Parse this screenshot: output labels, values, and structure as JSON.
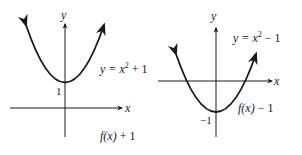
{
  "figure": {
    "panels": [
      {
        "id": "left",
        "equation": {
          "prefix": "y = x",
          "exp": "2",
          "suffix": " + 1"
        },
        "caption": {
          "f": "f",
          "args": "(x)",
          "rest": " + 1"
        },
        "vertex_label": "1",
        "axis_x_label": "x",
        "axis_y_label": "y"
      },
      {
        "id": "right",
        "equation": {
          "prefix": "y = x",
          "exp": "2",
          "suffix": " − 1"
        },
        "caption": {
          "f": "f",
          "args": "(x)",
          "rest": " − 1"
        },
        "vertex_label": "−1",
        "axis_x_label": "x",
        "axis_y_label": "y"
      }
    ],
    "colors": {
      "ink": "#1a1a1a",
      "background": "#ffffff"
    }
  }
}
